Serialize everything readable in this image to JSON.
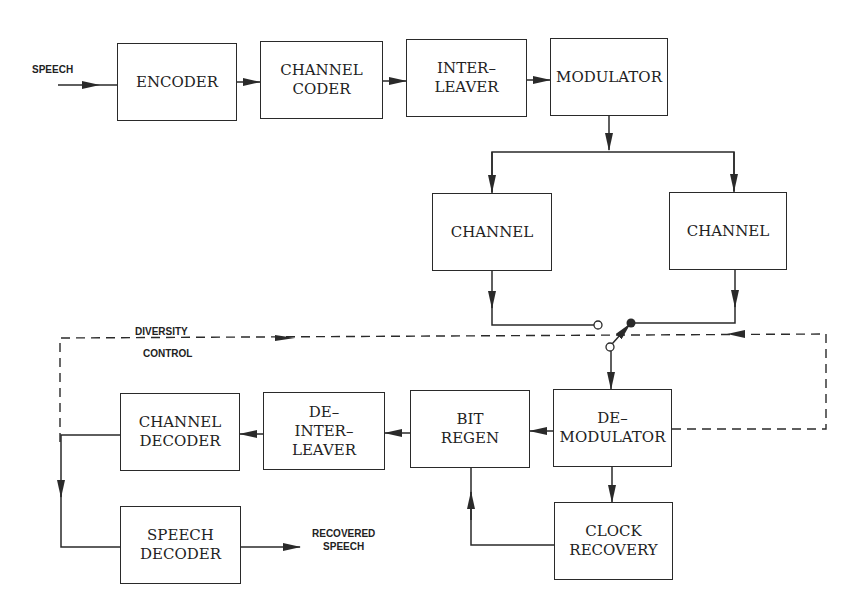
{
  "diagram": {
    "type": "block-diagram",
    "title": "",
    "inputs": {
      "speech_in": "SPEECH"
    },
    "outputs": {
      "speech_out": "RECOVERED\nSPEECH"
    },
    "control_label": {
      "line1": "DIVERSITY",
      "line2": "CONTROL"
    },
    "blocks": {
      "encoder": "ENCODER",
      "channel_coder": "CHANNEL\nCODER",
      "interleaver": "INTER–\nLEAVER",
      "modulator": "MODULATOR",
      "channel_left": "CHANNEL",
      "channel_right": "CHANNEL",
      "demodulator": "DE–\nMODULATOR",
      "bit_regen": "BIT\nREGEN",
      "deinterleaver": "DE–\nINTER–\nLEAVER",
      "channel_decoder": "CHANNEL\nDECODER",
      "speech_decoder": "SPEECH\nDECODER",
      "clock_recovery": "CLOCK\nRECOVERY"
    },
    "connections": [
      [
        "SPEECH",
        "ENCODER"
      ],
      [
        "ENCODER",
        "CHANNEL CODER"
      ],
      [
        "CHANNEL CODER",
        "INTER-LEAVER"
      ],
      [
        "INTER-LEAVER",
        "MODULATOR"
      ],
      [
        "MODULATOR",
        "CHANNEL (left)"
      ],
      [
        "MODULATOR",
        "CHANNEL (right)"
      ],
      [
        "CHANNEL (left)",
        "diversity switch"
      ],
      [
        "CHANNEL (right)",
        "diversity switch"
      ],
      [
        "diversity switch",
        "DE-MODULATOR"
      ],
      [
        "DE-MODULATOR",
        "BIT REGEN"
      ],
      [
        "DE-MODULATOR",
        "CLOCK RECOVERY"
      ],
      [
        "CLOCK RECOVERY",
        "BIT REGEN"
      ],
      [
        "BIT REGEN",
        "DE-INTER-LEAVER"
      ],
      [
        "DE-INTER-LEAVER",
        "CHANNEL DECODER"
      ],
      [
        "CHANNEL DECODER",
        "SPEECH DECODER"
      ],
      [
        "SPEECH DECODER",
        "RECOVERED SPEECH"
      ],
      [
        "DE-MODULATOR",
        "diversity switch (dashed: DIVERSITY CONTROL)"
      ]
    ],
    "colors": {
      "line": "#2a2a2a",
      "background": "#ffffff"
    }
  }
}
